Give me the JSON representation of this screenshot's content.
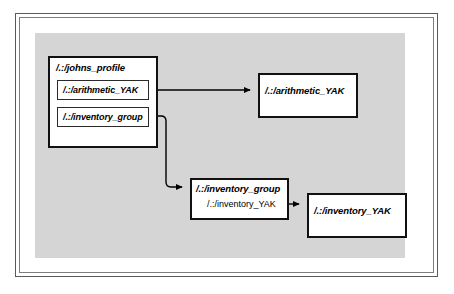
{
  "diagram": {
    "title_text": "",
    "background_color": "#ffffff",
    "panel_color": "#d5d5d5",
    "frame_color": "#5a5a5a",
    "node_border_color": "#111111",
    "node_fill_color": "#ffffff",
    "connector_color": "#000000"
  },
  "nodes": {
    "johns_profile": {
      "label": "/.:/johns_profile",
      "children": [
        {
          "label": "/.:/arithmetic_YAK"
        },
        {
          "label": "/.:/inventory_group"
        }
      ]
    },
    "arithmetic_yak_target": {
      "label": "/.:/arithmetic_YAK"
    },
    "inventory_group_target": {
      "label": "/.:/inventory_group",
      "entry": "/.:/inventory_YAK"
    },
    "inventory_yak_target": {
      "label": "/.:/inventory_YAK"
    }
  },
  "connectors": [
    {
      "name": "arithmetic-link",
      "from": "/.:/arithmetic_YAK",
      "to": "/.:/arithmetic_YAK",
      "style": "straight-arrow"
    },
    {
      "name": "inventory-group-link",
      "from": "/.:/inventory_group",
      "to": "/.:/inventory_group",
      "style": "elbow-arrow"
    },
    {
      "name": "inventory-yak-link",
      "from": "/.:/inventory_YAK",
      "to": "/.:/inventory_YAK",
      "style": "straight-arrow"
    }
  ]
}
